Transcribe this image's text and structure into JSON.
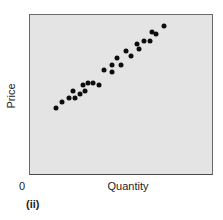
{
  "chart_data": {
    "type": "scatter",
    "title": "",
    "xlabel": "Quantity",
    "ylabel": "Price",
    "origin_label": "0",
    "panel_label": "(ii)",
    "xlim": [
      0,
      100
    ],
    "ylim": [
      0,
      100
    ],
    "grid": false,
    "legend": null,
    "colors": {
      "background": "#e4e4e4",
      "marker": "#0d0d0d",
      "frame": "#6a6a6a"
    },
    "note": "Axes unlabeled numerically; values are normalized positions (0-100) within the plot frame.",
    "series": [
      {
        "name": "observations",
        "points": [
          {
            "x": 14.1,
            "y": 41.6
          },
          {
            "x": 17.4,
            "y": 45.3
          },
          {
            "x": 21.2,
            "y": 47.8
          },
          {
            "x": 23.4,
            "y": 52.2
          },
          {
            "x": 24.5,
            "y": 47.8
          },
          {
            "x": 27.2,
            "y": 50.3
          },
          {
            "x": 29.3,
            "y": 55.9
          },
          {
            "x": 30.4,
            "y": 52.2
          },
          {
            "x": 32.1,
            "y": 57.1
          },
          {
            "x": 34.8,
            "y": 57.1
          },
          {
            "x": 38.0,
            "y": 55.9
          },
          {
            "x": 40.8,
            "y": 65.2
          },
          {
            "x": 45.1,
            "y": 68.3
          },
          {
            "x": 45.1,
            "y": 64.0
          },
          {
            "x": 47.8,
            "y": 72.7
          },
          {
            "x": 50.0,
            "y": 68.3
          },
          {
            "x": 52.7,
            "y": 77.6
          },
          {
            "x": 55.4,
            "y": 74.5
          },
          {
            "x": 58.7,
            "y": 82.0
          },
          {
            "x": 59.8,
            "y": 78.9
          },
          {
            "x": 62.5,
            "y": 83.9
          },
          {
            "x": 65.8,
            "y": 83.9
          },
          {
            "x": 66.8,
            "y": 89.4
          },
          {
            "x": 69.0,
            "y": 88.2
          },
          {
            "x": 73.4,
            "y": 93.2
          }
        ]
      }
    ]
  }
}
